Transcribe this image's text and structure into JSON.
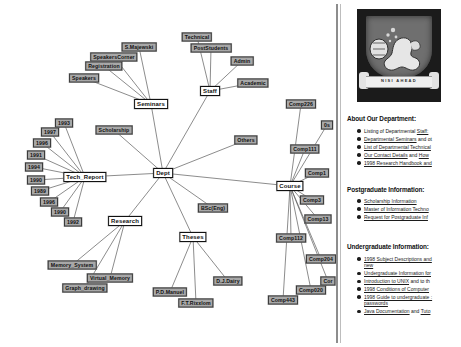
{
  "graph": {
    "title": "hyperbolic-tree-graph",
    "nodes": [
      {
        "id": "dept",
        "label": "Dept",
        "x": 163,
        "y": 173,
        "cls": "focus"
      },
      {
        "id": "seminars",
        "label": "Seminars",
        "x": 151,
        "y": 104,
        "cls": "focus"
      },
      {
        "id": "staff",
        "label": "Staff",
        "x": 210,
        "y": 91,
        "cls": "focus"
      },
      {
        "id": "tech_report",
        "label": "Tech_Report",
        "x": 85,
        "y": 177,
        "cls": "focus"
      },
      {
        "id": "course",
        "label": "Course",
        "x": 290,
        "y": 186,
        "cls": "focus"
      },
      {
        "id": "research",
        "label": "Research",
        "x": 125,
        "y": 221,
        "cls": "focus"
      },
      {
        "id": "theses",
        "label": "Theses",
        "x": 193,
        "y": 237,
        "cls": "focus"
      },
      {
        "id": "smajewski",
        "label": "S.Majewski",
        "x": 139,
        "y": 47
      },
      {
        "id": "speakerscorner",
        "label": "SpeakersCorner",
        "x": 114,
        "y": 57
      },
      {
        "id": "registration",
        "label": "Registration",
        "x": 104,
        "y": 66
      },
      {
        "id": "speakers",
        "label": "Speakers",
        "x": 84,
        "y": 78
      },
      {
        "id": "technical",
        "label": "Technical",
        "x": 197,
        "y": 37
      },
      {
        "id": "poststudents",
        "label": "PostStudents",
        "x": 211,
        "y": 48
      },
      {
        "id": "admin",
        "label": "Admin",
        "x": 242,
        "y": 61
      },
      {
        "id": "academic",
        "label": "Academic",
        "x": 253,
        "y": 83
      },
      {
        "id": "scholarship",
        "label": "Scholarship",
        "x": 114,
        "y": 130
      },
      {
        "id": "others",
        "label": "Others",
        "x": 246,
        "y": 140
      },
      {
        "id": "bsceng",
        "label": "BSc(Eng)",
        "x": 213,
        "y": 208
      },
      {
        "id": "y1993",
        "label": "1993",
        "x": 64,
        "y": 123
      },
      {
        "id": "y1997",
        "label": "1997",
        "x": 50,
        "y": 132
      },
      {
        "id": "y1996a",
        "label": "1996",
        "x": 42,
        "y": 143
      },
      {
        "id": "y1991",
        "label": "1991",
        "x": 36,
        "y": 155
      },
      {
        "id": "y1994",
        "label": "1994",
        "x": 34,
        "y": 167
      },
      {
        "id": "y1990a",
        "label": "1990",
        "x": 36,
        "y": 180
      },
      {
        "id": "y1989",
        "label": "1989",
        "x": 40,
        "y": 191
      },
      {
        "id": "y1996b",
        "label": "1996",
        "x": 49,
        "y": 202
      },
      {
        "id": "y1990b",
        "label": "1990",
        "x": 60,
        "y": 212
      },
      {
        "id": "y1992",
        "label": "1992",
        "x": 73,
        "y": 222
      },
      {
        "id": "memory_system",
        "label": "Memory_System",
        "x": 72,
        "y": 265
      },
      {
        "id": "virtual_memory",
        "label": "Virtual_Memory",
        "x": 110,
        "y": 278
      },
      {
        "id": "graph_drawing",
        "label": "Graph_drawing",
        "x": 85,
        "y": 288
      },
      {
        "id": "pdmanuel",
        "label": "P.D.Manuel",
        "x": 170,
        "y": 292
      },
      {
        "id": "ftrixxlom",
        "label": "F.T.Rixxlom",
        "x": 196,
        "y": 303
      },
      {
        "id": "djdairy",
        "label": "D.J.Dairy",
        "x": 228,
        "y": 281
      },
      {
        "id": "comp226",
        "label": "Comp226",
        "x": 301,
        "y": 104
      },
      {
        "id": "comp0x",
        "label": "0s",
        "x": 327,
        "y": 125
      },
      {
        "id": "comp111",
        "label": "Comp111",
        "x": 305,
        "y": 149
      },
      {
        "id": "comp1",
        "label": "Comp1",
        "x": 317,
        "y": 173
      },
      {
        "id": "comp3",
        "label": "Comp3",
        "x": 312,
        "y": 200
      },
      {
        "id": "comp13",
        "label": "Comp13",
        "x": 318,
        "y": 219
      },
      {
        "id": "comp112",
        "label": "Comp112",
        "x": 291,
        "y": 238
      },
      {
        "id": "comp204",
        "label": "Comp204",
        "x": 321,
        "y": 259
      },
      {
        "id": "cor",
        "label": "Cor",
        "x": 328,
        "y": 281
      },
      {
        "id": "comp020",
        "label": "Comp020",
        "x": 311,
        "y": 290
      },
      {
        "id": "comp443",
        "label": "Comp443",
        "x": 283,
        "y": 300
      }
    ],
    "edges": [
      [
        "dept",
        "seminars"
      ],
      [
        "dept",
        "staff"
      ],
      [
        "dept",
        "tech_report"
      ],
      [
        "dept",
        "course"
      ],
      [
        "dept",
        "research"
      ],
      [
        "dept",
        "theses"
      ],
      [
        "dept",
        "scholarship"
      ],
      [
        "dept",
        "others"
      ],
      [
        "dept",
        "bsceng"
      ],
      [
        "seminars",
        "smajewski"
      ],
      [
        "seminars",
        "speakerscorner"
      ],
      [
        "seminars",
        "registration"
      ],
      [
        "seminars",
        "speakers"
      ],
      [
        "staff",
        "technical"
      ],
      [
        "staff",
        "poststudents"
      ],
      [
        "staff",
        "admin"
      ],
      [
        "staff",
        "academic"
      ],
      [
        "tech_report",
        "y1993"
      ],
      [
        "tech_report",
        "y1997"
      ],
      [
        "tech_report",
        "y1996a"
      ],
      [
        "tech_report",
        "y1991"
      ],
      [
        "tech_report",
        "y1994"
      ],
      [
        "tech_report",
        "y1990a"
      ],
      [
        "tech_report",
        "y1989"
      ],
      [
        "tech_report",
        "y1996b"
      ],
      [
        "tech_report",
        "y1990b"
      ],
      [
        "tech_report",
        "y1992"
      ],
      [
        "research",
        "memory_system"
      ],
      [
        "research",
        "virtual_memory"
      ],
      [
        "research",
        "graph_drawing"
      ],
      [
        "theses",
        "pdmanuel"
      ],
      [
        "theses",
        "ftrixxlom"
      ],
      [
        "theses",
        "djdairy"
      ],
      [
        "course",
        "comp226"
      ],
      [
        "course",
        "comp0x"
      ],
      [
        "course",
        "comp111"
      ],
      [
        "course",
        "comp1"
      ],
      [
        "course",
        "comp3"
      ],
      [
        "course",
        "comp13"
      ],
      [
        "course",
        "comp112"
      ],
      [
        "course",
        "comp204"
      ],
      [
        "course",
        "cor"
      ],
      [
        "course",
        "comp020"
      ],
      [
        "course",
        "comp443"
      ]
    ]
  },
  "web": {
    "crest": {
      "motto": "NISI  AHEAD",
      "alt": "university-crest"
    },
    "sections": [
      {
        "title": "About Our Department:",
        "items": [
          [
            {
              "t": "Listing of Departmental ",
              "u": false
            },
            {
              "t": "Staff:",
              "u": true
            }
          ],
          [
            {
              "t": "Departmental Seminars",
              "u": true
            },
            {
              "t": " and ot",
              "u": false
            }
          ],
          [
            {
              "t": "List of Departmental Technical",
              "u": true
            }
          ],
          [
            {
              "t": "Our Contact Details",
              "u": true
            },
            {
              "t": " and ",
              "u": false
            },
            {
              "t": "How",
              "u": true
            }
          ],
          [
            {
              "t": "1998 Research Handbook and",
              "u": true
            }
          ]
        ]
      },
      {
        "title": "Postgraduate Information:",
        "items": [
          [
            {
              "t": "Scholarship Information",
              "u": true
            }
          ],
          [
            {
              "t": "Master of Information Techno",
              "u": true
            }
          ],
          [
            {
              "t": "Request for Postgraduate Inf",
              "u": true
            }
          ]
        ]
      },
      {
        "title": "Undergraduate Information:",
        "items": [
          [
            {
              "t": "1998 Subject Descriptions and",
              "u": true
            },
            {
              "t": "new",
              "u": true,
              "nl": true
            }
          ],
          [
            {
              "t": "Undergraduate Information for",
              "u": true
            }
          ],
          [
            {
              "t": "Introduction to UNIX",
              "u": true
            },
            {
              "t": " and to th",
              "u": false
            }
          ],
          [
            {
              "t": "1998 Conditions of Computer",
              "u": true
            }
          ],
          [
            {
              "t": "1998 Guide to undergraduate :",
              "u": true
            },
            {
              "t": "passwords",
              "u": true,
              "nl": true
            }
          ],
          [
            {
              "t": "Java Documentation",
              "u": true
            },
            {
              "t": " and ",
              "u": false
            },
            {
              "t": "Tuto",
              "u": true
            }
          ]
        ]
      }
    ]
  }
}
